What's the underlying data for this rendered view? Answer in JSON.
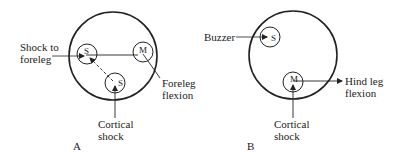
{
  "panels": [
    {
      "id": "A",
      "label": "A",
      "nodes": [
        {
          "symbol": "S",
          "role": "sensory"
        },
        {
          "symbol": "M",
          "role": "motor"
        },
        {
          "symbol": "S",
          "role": "sensory-cortical"
        }
      ],
      "labels": {
        "input_line1": "Shock to",
        "input_line2": "foreleg",
        "output_line1": "Foreleg",
        "output_line2": "flexion",
        "bottom_line1": "Cortical",
        "bottom_line2": "shock"
      }
    },
    {
      "id": "B",
      "label": "B",
      "nodes": [
        {
          "symbol": "S",
          "role": "sensory"
        },
        {
          "symbol": "M",
          "role": "motor"
        }
      ],
      "labels": {
        "input": "Buzzer",
        "output_line1": "Hind leg",
        "output_line2": "flexion",
        "bottom_line1": "Cortical",
        "bottom_line2": "shock"
      }
    }
  ],
  "colors": {
    "stroke": "#222222",
    "background": "#ffffff"
  }
}
